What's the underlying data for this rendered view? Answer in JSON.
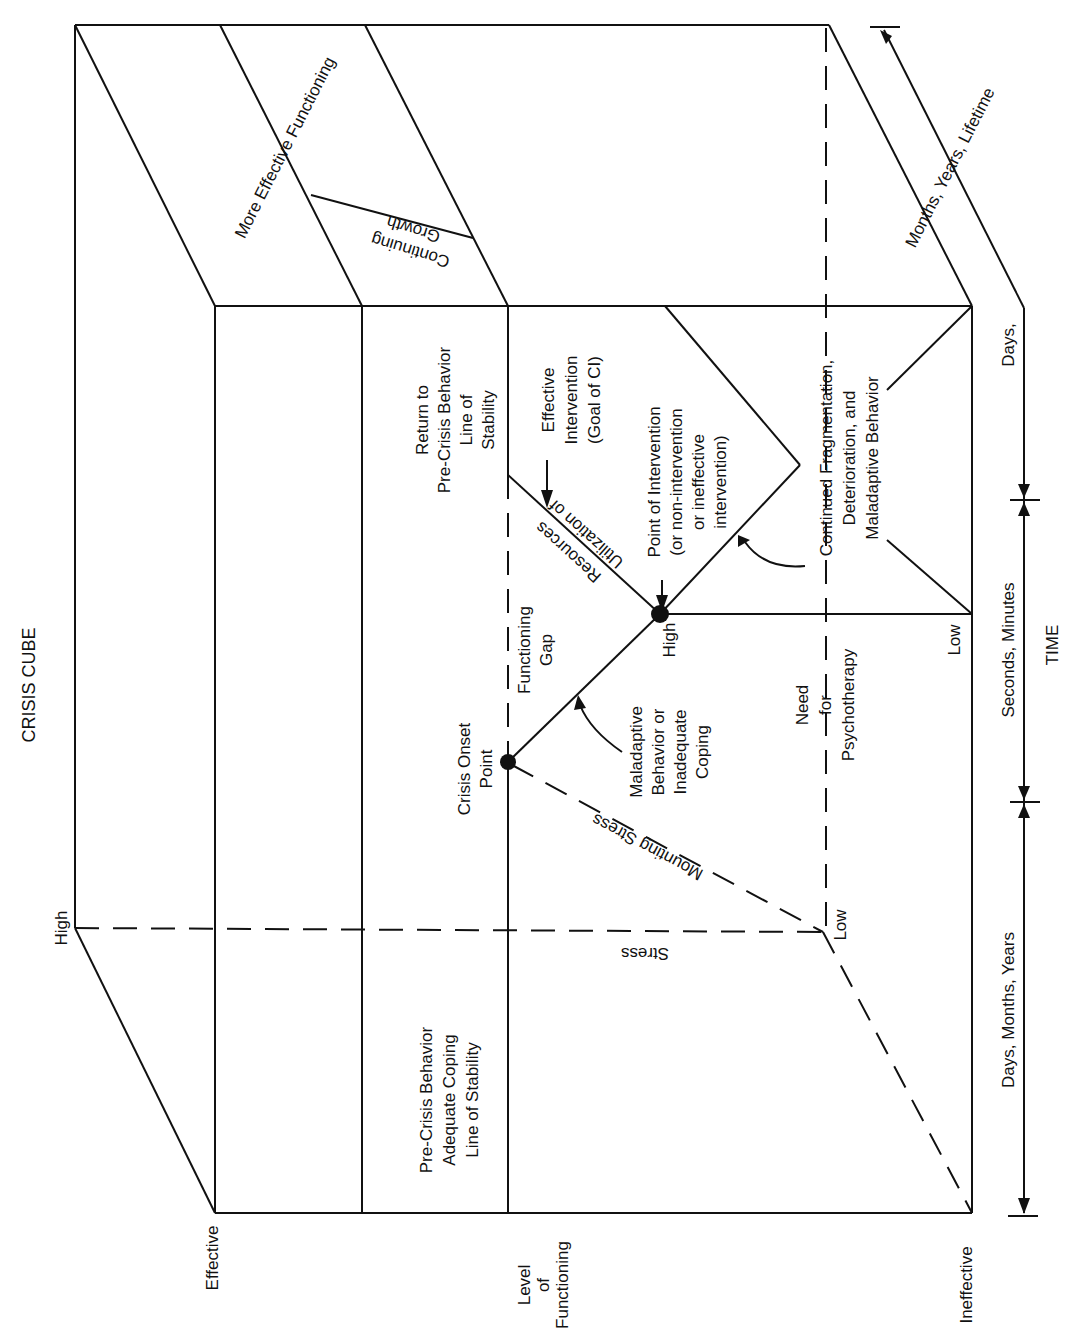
{
  "title": "CRISIS CUBE",
  "axes": {
    "level_of_functioning": {
      "label_lines": [
        "Level",
        "of",
        "Functioning"
      ],
      "effective": "Effective",
      "ineffective": "Ineffective"
    },
    "stress": {
      "label": "Stress",
      "high": "High",
      "low": "Low",
      "mounting": "Mounting Stress"
    },
    "time": {
      "label": "TIME",
      "segments": [
        "Days, Months, Years",
        "Seconds, Minutes",
        "Days, Months, Years, Lifetime"
      ]
    },
    "intervention_axis": {
      "high": "High",
      "low": "Low"
    }
  },
  "regions": {
    "pre_crisis": [
      "Pre-Crisis Behavior",
      "Adequate Coping",
      "Line of Stability"
    ],
    "crisis_onset": [
      "Crisis Onset",
      "Point"
    ],
    "functioning_gap": [
      "Functioning",
      "Gap"
    ],
    "maladaptive": [
      "Maladaptive",
      "Behavior or",
      "Inadequate",
      "Coping"
    ],
    "need_psychotherapy": [
      "Need",
      "for",
      "Psychotherapy"
    ],
    "utilization": [
      "Utilization of",
      "Resources"
    ],
    "point_of_intervention": [
      "Point of Intervention",
      "(or non-intervention",
      "or ineffective",
      "intervention)"
    ],
    "effective_intervention": [
      "Effective",
      "Intervention",
      "(Goal of CI)"
    ],
    "return_to_precrisis": [
      "Return to",
      "Pre-Crisis Behavior",
      "Line of",
      "Stability"
    ],
    "continued_fragmentation": [
      "Continued Fragmentation,",
      "Deterioration, and",
      "Maladaptive Behavior"
    ],
    "more_effective": "More Effective Functioning",
    "continuing_growth": [
      "Continuing",
      "Growth"
    ]
  },
  "colors": {
    "ink": "#111111",
    "paper": "#ffffff"
  }
}
